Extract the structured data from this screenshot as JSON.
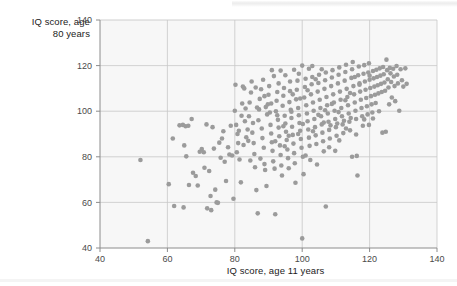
{
  "figure": {
    "background_color": "#ffffff",
    "plot_background_color": "#f7f7f7",
    "axis_color": "#8c8c8c",
    "grid_color": "#c8c8c8",
    "point_color": "#9b9b9b",
    "point_radius_px": 2.3
  },
  "artifacts": {
    "top_scan_line": "scan-line-artifact",
    "bottom_scan_line": "scan-line-artifact"
  },
  "chart_data": {
    "type": "scatter",
    "title": "",
    "xlabel": "IQ score, age 11 years",
    "ylabel": "IQ score, age\n80 years",
    "ylabel_line1": "IQ score, age",
    "ylabel_line2": "80 years",
    "xlim": [
      40,
      140
    ],
    "ylim": [
      40,
      140
    ],
    "xticks": [
      40,
      60,
      80,
      100,
      120,
      140
    ],
    "yticks": [
      40,
      60,
      80,
      100,
      120,
      140
    ],
    "xtick_labels": [
      "40",
      "60",
      "80",
      "100",
      "120",
      "140"
    ],
    "ytick_labels": [
      "40",
      "60",
      "80",
      "100",
      "120",
      "140"
    ],
    "grid": true,
    "legend": false,
    "marker": "circle",
    "points": [
      [
        52.0,
        78.6
      ],
      [
        54.2,
        43.0
      ],
      [
        60.4,
        68.0
      ],
      [
        61.6,
        88.0
      ],
      [
        62.0,
        58.4
      ],
      [
        64.8,
        57.8
      ],
      [
        63.6,
        93.8
      ],
      [
        64.6,
        94.0
      ],
      [
        65.4,
        93.4
      ],
      [
        66.2,
        93.6
      ],
      [
        65.0,
        85.0
      ],
      [
        65.6,
        80.2
      ],
      [
        66.4,
        67.6
      ],
      [
        67.2,
        96.6
      ],
      [
        67.6,
        73.0
      ],
      [
        68.4,
        71.6
      ],
      [
        69.0,
        67.4
      ],
      [
        69.6,
        82.2
      ],
      [
        70.2,
        83.4
      ],
      [
        70.8,
        82.0
      ],
      [
        71.0,
        75.2
      ],
      [
        71.6,
        94.2
      ],
      [
        71.8,
        57.4
      ],
      [
        72.4,
        73.8
      ],
      [
        72.8,
        62.8
      ],
      [
        73.0,
        56.6
      ],
      [
        73.4,
        93.0
      ],
      [
        73.8,
        83.6
      ],
      [
        74.2,
        65.6
      ],
      [
        74.6,
        60.0
      ],
      [
        75.0,
        59.8
      ],
      [
        75.4,
        86.2
      ],
      [
        75.8,
        79.6
      ],
      [
        76.2,
        88.0
      ],
      [
        76.6,
        91.2
      ],
      [
        77.0,
        77.8
      ],
      [
        77.4,
        69.4
      ],
      [
        78.0,
        84.2
      ],
      [
        78.4,
        81.0
      ],
      [
        78.8,
        93.6
      ],
      [
        79.2,
        80.6
      ],
      [
        79.6,
        61.6
      ],
      [
        80.0,
        100.2
      ],
      [
        80.2,
        111.6
      ],
      [
        80.6,
        82.0
      ],
      [
        80.8,
        90.0
      ],
      [
        81.0,
        86.0
      ],
      [
        81.4,
        78.8
      ],
      [
        81.8,
        68.8
      ],
      [
        82.2,
        103.4
      ],
      [
        82.4,
        110.8
      ],
      [
        82.8,
        110.0
      ],
      [
        83.0,
        95.6
      ],
      [
        83.4,
        88.6
      ],
      [
        83.8,
        92.0
      ],
      [
        84.2,
        97.8
      ],
      [
        84.4,
        103.8
      ],
      [
        84.8,
        108.2
      ],
      [
        85.0,
        113.0
      ],
      [
        85.2,
        90.6
      ],
      [
        85.6,
        86.0
      ],
      [
        85.8,
        81.2
      ],
      [
        86.0,
        75.4
      ],
      [
        86.4,
        65.4
      ],
      [
        86.8,
        55.2
      ],
      [
        87.0,
        96.0
      ],
      [
        87.2,
        100.8
      ],
      [
        87.4,
        105.4
      ],
      [
        87.8,
        109.6
      ],
      [
        88.0,
        92.4
      ],
      [
        88.2,
        88.2
      ],
      [
        88.6,
        84.0
      ],
      [
        88.8,
        76.8
      ],
      [
        89.0,
        74.2
      ],
      [
        89.4,
        67.2
      ],
      [
        89.6,
        98.6
      ],
      [
        89.8,
        103.0
      ],
      [
        90.0,
        107.2
      ],
      [
        90.2,
        111.0
      ],
      [
        90.6,
        94.0
      ],
      [
        90.8,
        90.2
      ],
      [
        91.0,
        86.4
      ],
      [
        91.2,
        82.6
      ],
      [
        91.4,
        78.0
      ],
      [
        91.8,
        74.8
      ],
      [
        92.0,
        54.8
      ],
      [
        92.2,
        100.0
      ],
      [
        92.4,
        104.6
      ],
      [
        92.6,
        108.4
      ],
      [
        92.8,
        96.2
      ],
      [
        93.0,
        92.8
      ],
      [
        93.2,
        89.0
      ],
      [
        93.4,
        85.0
      ],
      [
        93.6,
        80.8
      ],
      [
        93.8,
        76.2
      ],
      [
        94.0,
        71.8
      ],
      [
        94.2,
        102.4
      ],
      [
        94.4,
        106.8
      ],
      [
        94.6,
        110.2
      ],
      [
        94.8,
        98.0
      ],
      [
        95.0,
        94.6
      ],
      [
        95.2,
        91.0
      ],
      [
        95.4,
        87.4
      ],
      [
        95.6,
        83.2
      ],
      [
        95.8,
        79.4
      ],
      [
        96.0,
        75.0
      ],
      [
        96.2,
        104.0
      ],
      [
        96.4,
        108.8
      ],
      [
        96.6,
        100.6
      ],
      [
        96.8,
        97.0
      ],
      [
        97.0,
        93.2
      ],
      [
        97.2,
        89.6
      ],
      [
        97.4,
        85.8
      ],
      [
        97.6,
        81.6
      ],
      [
        97.8,
        77.2
      ],
      [
        98.0,
        68.6
      ],
      [
        98.2,
        105.2
      ],
      [
        98.4,
        109.4
      ],
      [
        98.6,
        113.4
      ],
      [
        98.8,
        101.4
      ],
      [
        99.0,
        98.2
      ],
      [
        99.2,
        94.8
      ],
      [
        99.4,
        91.4
      ],
      [
        99.6,
        87.8
      ],
      [
        99.8,
        84.0
      ],
      [
        100.0,
        120.0
      ],
      [
        100.0,
        44.2
      ],
      [
        100.2,
        80.0
      ],
      [
        100.4,
        72.4
      ],
      [
        100.6,
        106.0
      ],
      [
        100.8,
        110.6
      ],
      [
        101.0,
        114.2
      ],
      [
        101.2,
        102.6
      ],
      [
        101.4,
        99.0
      ],
      [
        101.6,
        95.6
      ],
      [
        101.8,
        92.0
      ],
      [
        102.0,
        88.4
      ],
      [
        102.2,
        84.8
      ],
      [
        102.4,
        78.6
      ],
      [
        102.6,
        107.4
      ],
      [
        102.8,
        111.8
      ],
      [
        103.0,
        115.0
      ],
      [
        103.2,
        103.8
      ],
      [
        103.4,
        100.2
      ],
      [
        103.6,
        96.6
      ],
      [
        103.8,
        93.0
      ],
      [
        104.0,
        89.4
      ],
      [
        104.2,
        85.6
      ],
      [
        104.4,
        76.6
      ],
      [
        104.6,
        108.6
      ],
      [
        104.8,
        112.4
      ],
      [
        105.0,
        116.0
      ],
      [
        105.2,
        105.0
      ],
      [
        105.4,
        101.4
      ],
      [
        105.6,
        97.8
      ],
      [
        105.8,
        94.2
      ],
      [
        106.0,
        90.6
      ],
      [
        106.2,
        86.8
      ],
      [
        106.4,
        82.4
      ],
      [
        106.6,
        109.8
      ],
      [
        106.8,
        113.6
      ],
      [
        107.0,
        117.0
      ],
      [
        107.0,
        58.2
      ],
      [
        107.2,
        106.2
      ],
      [
        107.4,
        102.6
      ],
      [
        107.6,
        99.0
      ],
      [
        107.8,
        95.4
      ],
      [
        108.0,
        91.8
      ],
      [
        108.2,
        88.0
      ],
      [
        108.4,
        93.8
      ],
      [
        108.6,
        111.0
      ],
      [
        108.8,
        114.8
      ],
      [
        109.0,
        118.0
      ],
      [
        109.2,
        107.4
      ],
      [
        109.4,
        103.8
      ],
      [
        109.6,
        100.2
      ],
      [
        109.8,
        96.6
      ],
      [
        110.0,
        93.0
      ],
      [
        110.2,
        89.2
      ],
      [
        110.4,
        94.6
      ],
      [
        110.6,
        112.2
      ],
      [
        110.8,
        116.0
      ],
      [
        111.0,
        119.2
      ],
      [
        111.2,
        108.6
      ],
      [
        111.4,
        105.0
      ],
      [
        111.6,
        101.4
      ],
      [
        111.8,
        97.8
      ],
      [
        112.0,
        94.2
      ],
      [
        112.2,
        90.4
      ],
      [
        112.4,
        95.8
      ],
      [
        112.6,
        113.4
      ],
      [
        112.8,
        117.2
      ],
      [
        113.0,
        120.4
      ],
      [
        113.2,
        109.8
      ],
      [
        113.4,
        106.2
      ],
      [
        113.6,
        102.6
      ],
      [
        113.8,
        99.0
      ],
      [
        114.0,
        95.4
      ],
      [
        114.2,
        91.6
      ],
      [
        114.4,
        97.0
      ],
      [
        114.6,
        114.6
      ],
      [
        114.8,
        118.4
      ],
      [
        115.0,
        121.6
      ],
      [
        115.2,
        111.0
      ],
      [
        115.4,
        107.4
      ],
      [
        115.6,
        103.8
      ],
      [
        115.8,
        100.2
      ],
      [
        116.0,
        96.6
      ],
      [
        116.2,
        80.4
      ],
      [
        116.4,
        71.8
      ],
      [
        116.6,
        115.8
      ],
      [
        116.8,
        119.6
      ],
      [
        117.0,
        112.2
      ],
      [
        117.2,
        108.6
      ],
      [
        117.4,
        105.0
      ],
      [
        117.6,
        101.4
      ],
      [
        117.8,
        97.8
      ],
      [
        118.0,
        93.6
      ],
      [
        118.2,
        116.4
      ],
      [
        118.4,
        120.2
      ],
      [
        118.6,
        113.0
      ],
      [
        118.8,
        109.4
      ],
      [
        119.0,
        105.8
      ],
      [
        119.2,
        102.2
      ],
      [
        119.4,
        98.6
      ],
      [
        119.6,
        117.0
      ],
      [
        119.8,
        121.0
      ],
      [
        120.0,
        113.8
      ],
      [
        120.2,
        110.2
      ],
      [
        120.4,
        106.6
      ],
      [
        120.6,
        103.0
      ],
      [
        120.8,
        99.4
      ],
      [
        121.0,
        117.6
      ],
      [
        121.2,
        114.4
      ],
      [
        121.4,
        110.8
      ],
      [
        121.6,
        107.2
      ],
      [
        121.8,
        103.6
      ],
      [
        122.0,
        118.2
      ],
      [
        122.2,
        115.0
      ],
      [
        122.4,
        111.4
      ],
      [
        122.6,
        107.8
      ],
      [
        122.8,
        100.0
      ],
      [
        123.0,
        118.8
      ],
      [
        123.2,
        115.6
      ],
      [
        123.4,
        112.0
      ],
      [
        123.6,
        108.4
      ],
      [
        123.8,
        90.6
      ],
      [
        124.0,
        119.4
      ],
      [
        124.2,
        116.2
      ],
      [
        124.4,
        112.6
      ],
      [
        124.6,
        109.0
      ],
      [
        124.8,
        91.0
      ],
      [
        125.0,
        122.6
      ],
      [
        125.2,
        118.0
      ],
      [
        125.4,
        114.0
      ],
      [
        125.6,
        110.4
      ],
      [
        125.8,
        103.0
      ],
      [
        126.0,
        119.0
      ],
      [
        126.2,
        116.6
      ],
      [
        126.4,
        112.8
      ],
      [
        126.6,
        106.0
      ],
      [
        127.0,
        118.6
      ],
      [
        127.2,
        115.2
      ],
      [
        127.4,
        111.0
      ],
      [
        127.6,
        104.4
      ],
      [
        128.0,
        119.8
      ],
      [
        128.2,
        116.0
      ],
      [
        128.4,
        112.2
      ],
      [
        128.8,
        100.2
      ],
      [
        129.2,
        118.4
      ],
      [
        129.6,
        113.6
      ],
      [
        130.0,
        110.8
      ],
      [
        130.6,
        118.8
      ],
      [
        131.0,
        112.0
      ],
      [
        82.0,
        98.0
      ],
      [
        83.2,
        101.2
      ],
      [
        84.0,
        87.0
      ],
      [
        86.2,
        110.4
      ],
      [
        88.4,
        113.8
      ],
      [
        91.6,
        115.4
      ],
      [
        93.6,
        117.8
      ],
      [
        96.4,
        113.0
      ],
      [
        99.0,
        116.4
      ],
      [
        102.0,
        118.6
      ],
      [
        80.4,
        94.0
      ],
      [
        81.2,
        91.4
      ],
      [
        82.6,
        85.2
      ],
      [
        84.6,
        78.4
      ],
      [
        85.4,
        94.8
      ],
      [
        86.6,
        101.6
      ],
      [
        87.6,
        79.2
      ],
      [
        88.8,
        106.6
      ],
      [
        90.4,
        99.4
      ],
      [
        92.0,
        86.8
      ],
      [
        93.0,
        112.2
      ],
      [
        94.8,
        84.6
      ],
      [
        96.0,
        89.2
      ],
      [
        97.2,
        107.4
      ],
      [
        98.8,
        90.0
      ],
      [
        100.2,
        94.4
      ],
      [
        101.0,
        80.6
      ],
      [
        103.2,
        91.2
      ],
      [
        104.8,
        98.4
      ],
      [
        106.4,
        95.0
      ],
      [
        108.0,
        84.2
      ],
      [
        109.8,
        82.6
      ],
      [
        111.0,
        87.2
      ],
      [
        113.0,
        92.4
      ],
      [
        114.8,
        80.0
      ],
      [
        116.0,
        89.8
      ],
      [
        118.4,
        96.4
      ],
      [
        119.8,
        94.0
      ],
      [
        121.0,
        96.8
      ],
      [
        115.6,
        115.0
      ],
      [
        105.8,
        118.4
      ],
      [
        103.0,
        119.8
      ],
      [
        97.6,
        118.2
      ],
      [
        91.0,
        118.0
      ],
      [
        95.0,
        115.8
      ],
      [
        89.2,
        101.8
      ],
      [
        90.8,
        103.4
      ],
      [
        92.6,
        98.2
      ],
      [
        94.4,
        93.4
      ],
      [
        96.8,
        99.8
      ],
      [
        99.4,
        105.6
      ],
      [
        101.6,
        109.2
      ],
      [
        104.0,
        114.0
      ],
      [
        106.8,
        100.4
      ],
      [
        108.8,
        103.2
      ],
      [
        110.8,
        99.6
      ],
      [
        112.8,
        104.8
      ],
      [
        114.2,
        108.0
      ],
      [
        117.0,
        111.6
      ],
      [
        120.0,
        115.6
      ]
    ]
  }
}
